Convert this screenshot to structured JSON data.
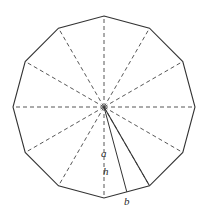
{
  "figure": {
    "name": "regular-dodecagon-with-apothem",
    "shape_type": "regular-polygon",
    "sides": 12,
    "center": {
      "x": 104,
      "y": 107
    },
    "circumradius": 91,
    "rotation_deg": -90,
    "stroke_color": "#333333",
    "dashed_stroke_color": "#444444",
    "background_color": "#ffffff",
    "vertices": [
      {
        "index": 0,
        "x": 104.0,
        "y": 16.0
      },
      {
        "index": 1,
        "x": 149.5,
        "y": 28.2
      },
      {
        "index": 2,
        "x": 182.8,
        "y": 61.5
      },
      {
        "index": 3,
        "x": 195.0,
        "y": 107.0
      },
      {
        "index": 4,
        "x": 182.8,
        "y": 152.5
      },
      {
        "index": 5,
        "x": 149.5,
        "y": 185.8
      },
      {
        "index": 6,
        "x": 104.0,
        "y": 198.0
      },
      {
        "index": 7,
        "x": 58.5,
        "y": 185.8
      },
      {
        "index": 8,
        "x": 25.2,
        "y": 152.5
      },
      {
        "index": 9,
        "x": 13.0,
        "y": 107.0
      },
      {
        "index": 10,
        "x": 25.2,
        "y": 61.5
      },
      {
        "index": 11,
        "x": 58.5,
        "y": 28.2
      }
    ],
    "radii_count": 12,
    "solid_radius_to_vertex_index": 5,
    "apothem_target_edge": "between vertex 5 and vertex 6",
    "apothem_foot": {
      "x": 126.8,
      "y": 191.9
    }
  },
  "labels": {
    "angle": {
      "text": "a",
      "meaning": "central-angle"
    },
    "apothem": {
      "text": "h",
      "meaning": "apothem-height"
    },
    "base": {
      "text": "b",
      "meaning": "side-length-base"
    }
  }
}
